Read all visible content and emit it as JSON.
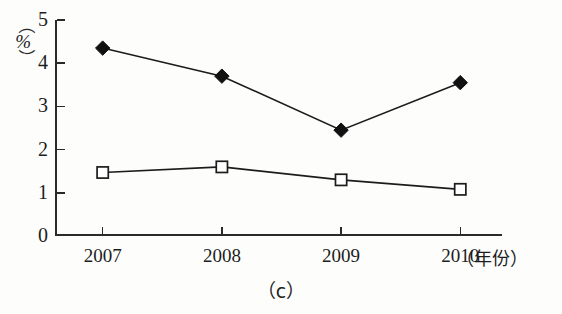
{
  "figure": {
    "caption": "（c）",
    "y_unit_label": "%",
    "x_unit_label": "（年份）"
  },
  "chart_data": {
    "type": "line",
    "title": "",
    "subtitle": "",
    "caption": "（c）",
    "xlabel": "（年份）",
    "ylabel": "（%）",
    "categories": [
      "2007",
      "2008",
      "2009",
      "2010"
    ],
    "x": [
      2007,
      2008,
      2009,
      2010
    ],
    "xlim": [
      2006.6,
      2010.35
    ],
    "ylim": [
      0,
      5
    ],
    "yticks": [
      0,
      1,
      2,
      3,
      4,
      5
    ],
    "ytick_labels": [
      "0",
      "1",
      "2",
      "3",
      "4",
      "5"
    ],
    "xtick_labels": [
      "2007",
      "2008",
      "2009",
      "2010"
    ],
    "grid": false,
    "legend": "none",
    "series": [
      {
        "name": "series-1",
        "marker": "filled-diamond",
        "color": "#111111",
        "values": [
          4.35,
          3.7,
          2.45,
          3.55
        ]
      },
      {
        "name": "series-2",
        "marker": "open-square",
        "color": "#1c1c1c",
        "values": [
          1.47,
          1.6,
          1.3,
          1.08
        ]
      }
    ]
  }
}
